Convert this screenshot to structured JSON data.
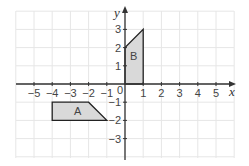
{
  "diagram": {
    "type": "coordinate-grid",
    "x_axis": {
      "label": "x",
      "min": -5,
      "max": 5,
      "ticks": [
        "-5",
        "-4",
        "-3",
        "-2",
        "-1",
        "1",
        "2",
        "3",
        "4",
        "5"
      ]
    },
    "y_axis": {
      "label": "y",
      "min": -3,
      "max": 3,
      "ticks": [
        "3",
        "2",
        "1",
        "-1",
        "-2",
        "-3"
      ]
    },
    "origin_label": "0",
    "shapes": [
      {
        "label": "A",
        "vertices": [
          [
            -4,
            -1
          ],
          [
            -2,
            -1
          ],
          [
            -1,
            -2
          ],
          [
            -4,
            -2
          ]
        ],
        "fill": "#d9d9d9"
      },
      {
        "label": "B",
        "vertices": [
          [
            0,
            0
          ],
          [
            0,
            2
          ],
          [
            1,
            3
          ],
          [
            1,
            0
          ]
        ],
        "fill": "#d9d9d9"
      }
    ],
    "colors": {
      "grid": "#e6e6e6",
      "axis": "#333333",
      "shape_stroke": "#222222"
    }
  }
}
